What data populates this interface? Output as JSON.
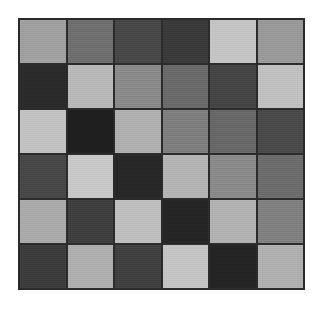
{
  "figure": {
    "background_color": "#ffffff",
    "grid_line_color": "#2b2b2b",
    "border_color": "#2b2b2b",
    "plot_left": 18,
    "plot_top": 18,
    "plot_width": 287,
    "plot_height": 272
  },
  "chart_data": {
    "type": "heatmap",
    "title": "",
    "subtitle": "",
    "xlabel": "",
    "ylabel": "",
    "grid": true,
    "legend": false,
    "legend_position": "none",
    "colormap": "grayscale",
    "rows": 6,
    "cols": 6,
    "xticklabels": [],
    "yticklabels": [],
    "value_range": [
      0,
      255
    ],
    "note": "6x6 grid of grayscale tiles separated by dark gridlines; values are 8-bit gray levels read from the pixels",
    "values": [
      [
        160,
        110,
        72,
        58,
        196,
        153
      ],
      [
        42,
        184,
        138,
        106,
        69,
        192
      ],
      [
        194,
        30,
        176,
        126,
        104,
        74
      ],
      [
        72,
        200,
        40,
        180,
        138,
        108
      ],
      [
        170,
        62,
        190,
        38,
        178,
        128
      ],
      [
        60,
        174,
        64,
        196,
        36,
        176
      ]
    ],
    "colors": [
      [
        "#a0a0a0",
        "#6e6e6e",
        "#484848",
        "#3a3a3a",
        "#c4c4c4",
        "#999999"
      ],
      [
        "#2a2a2a",
        "#b8b8b8",
        "#8a8a8a",
        "#6a6a6a",
        "#454545",
        "#c0c0c0"
      ],
      [
        "#c2c2c2",
        "#1e1e1e",
        "#b0b0b0",
        "#7e7e7e",
        "#686868",
        "#4a4a4a"
      ],
      [
        "#484848",
        "#c8c8c8",
        "#282828",
        "#b4b4b4",
        "#8a8a8a",
        "#6c6c6c"
      ],
      [
        "#aaaaaa",
        "#3e3e3e",
        "#bebebe",
        "#262626",
        "#b2b2b2",
        "#808080"
      ],
      [
        "#3c3c3c",
        "#aeaeae",
        "#404040",
        "#c4c4c4",
        "#242424",
        "#b0b0b0"
      ]
    ]
  }
}
